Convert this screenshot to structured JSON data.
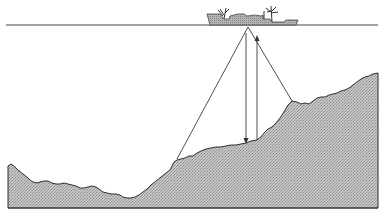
{
  "diagram": {
    "type": "sonar-echo-sounding-illustration",
    "colors": {
      "background": "#ffffff",
      "line": "#333333",
      "seabed_fill": "#b8b8b8",
      "ship_fill": "#a8a8a8"
    },
    "sea_surface": {
      "y": 25,
      "x1": 6,
      "x2": 378
    },
    "base_line": {
      "y": 208,
      "x1": 8,
      "x2": 378
    },
    "ship": {
      "x1": 207,
      "x2": 298,
      "top_y": 8,
      "waterline_y": 25,
      "transducer": {
        "x": 248,
        "y": 27
      }
    },
    "beams": {
      "left_outer": {
        "from": [
          248,
          27
        ],
        "to": [
          177,
          159
        ]
      },
      "right_outer": {
        "from": [
          248,
          27
        ],
        "to": [
          292,
          101
        ]
      },
      "down_ping": {
        "x": 246,
        "y1": 34,
        "y2": 143,
        "direction": "down"
      },
      "up_echo": {
        "x": 257,
        "y1": 140,
        "y2": 36,
        "direction": "up"
      }
    }
  }
}
